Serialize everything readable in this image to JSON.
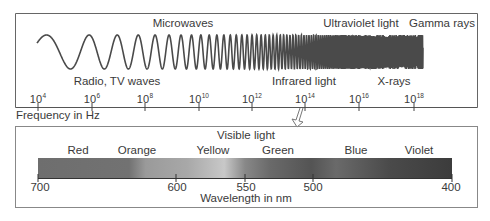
{
  "frequency_panel": {
    "band_labels_top": [
      {
        "text": "Microwaves",
        "x": 183,
        "y": 18
      },
      {
        "text": "Ultraviolet light",
        "x": 360,
        "y": 18
      },
      {
        "text": "Gamma rays",
        "x": 441,
        "y": 18
      }
    ],
    "band_labels_bottom": [
      {
        "text": "Radio, TV waves",
        "x": 117,
        "y": 74
      },
      {
        "text": "Infrared light",
        "x": 305,
        "y": 74
      },
      {
        "text": "X-rays",
        "x": 394,
        "y": 74
      }
    ],
    "axis_ticks": [
      {
        "base": "10",
        "exp": "4",
        "x": 38
      },
      {
        "base": "10",
        "exp": "6",
        "x": 92
      },
      {
        "base": "10",
        "exp": "8",
        "x": 145
      },
      {
        "base": "10",
        "exp": "10",
        "x": 199
      },
      {
        "base": "10",
        "exp": "12",
        "x": 252
      },
      {
        "base": "10",
        "exp": "14",
        "x": 305
      },
      {
        "base": "10",
        "exp": "16",
        "x": 359
      },
      {
        "base": "10",
        "exp": "18",
        "x": 414
      }
    ],
    "axis_title": "Frequency in Hz"
  },
  "visible_panel": {
    "title": "Visible light",
    "color_labels": [
      {
        "text": "Red",
        "x": 78
      },
      {
        "text": "Orange",
        "x": 137
      },
      {
        "text": "Yellow",
        "x": 213
      },
      {
        "text": "Green",
        "x": 278
      },
      {
        "text": "Blue",
        "x": 356
      },
      {
        "text": "Violet",
        "x": 419
      }
    ],
    "wavelength_ticks": [
      {
        "text": "700",
        "x": 38
      },
      {
        "text": "600",
        "x": 176
      },
      {
        "text": "550",
        "x": 245
      },
      {
        "text": "500",
        "x": 313
      },
      {
        "text": "400",
        "x": 452
      }
    ],
    "axis_title": "Wavelength in nm"
  },
  "colors": {
    "line": "#555555",
    "wave": "#4a4a4a",
    "text": "#3a3a3a"
  }
}
